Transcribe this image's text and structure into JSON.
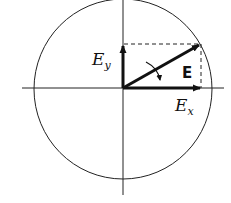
{
  "diagram": {
    "type": "vector-decomposition",
    "labels": {
      "ey_main": "E",
      "ey_sub": "y",
      "ex_main": "E",
      "ex_sub": "x",
      "e_vector": "E"
    },
    "colors": {
      "stroke": "#111111",
      "background": "#ffffff"
    }
  }
}
